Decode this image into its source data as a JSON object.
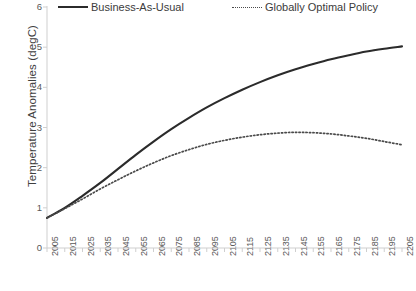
{
  "chart_data": {
    "type": "line",
    "title": "",
    "xlabel": "",
    "ylabel": "Temperature Anomalies (degC)",
    "xlim": [
      2005,
      2205
    ],
    "ylim": [
      0,
      6
    ],
    "grid": false,
    "legend_position": "top",
    "x": [
      2005,
      2015,
      2025,
      2035,
      2045,
      2055,
      2065,
      2075,
      2085,
      2095,
      2105,
      2115,
      2125,
      2135,
      2145,
      2155,
      2165,
      2175,
      2185,
      2195,
      2205
    ],
    "xticklabels": [
      "2005",
      "2015",
      "2025",
      "2035",
      "2045",
      "2055",
      "2065",
      "2075",
      "2085",
      "2095",
      "2105",
      "2115",
      "2125",
      "2135",
      "2145",
      "2155",
      "2165",
      "2175",
      "2185",
      "2195",
      "2205"
    ],
    "yticklabels": [
      "0",
      "1",
      "2",
      "3",
      "4",
      "5",
      "6"
    ],
    "yticks": [
      0,
      1,
      2,
      3,
      4,
      5,
      6
    ],
    "series": [
      {
        "name": "Business-As-Usual",
        "style": "solid",
        "color": "#2b2b2b",
        "values": [
          0.75,
          1.0,
          1.3,
          1.62,
          1.97,
          2.32,
          2.65,
          2.96,
          3.24,
          3.5,
          3.73,
          3.94,
          4.13,
          4.3,
          4.45,
          4.58,
          4.7,
          4.8,
          4.89,
          4.96,
          5.02
        ]
      },
      {
        "name": "Globally Optimal Policy",
        "style": "dotted",
        "color": "#4a4a4a",
        "values": [
          0.75,
          0.98,
          1.22,
          1.47,
          1.7,
          1.92,
          2.12,
          2.3,
          2.45,
          2.58,
          2.68,
          2.76,
          2.82,
          2.86,
          2.88,
          2.87,
          2.84,
          2.79,
          2.73,
          2.65,
          2.57
        ]
      }
    ]
  },
  "legend": {
    "entries": [
      {
        "label": "Business-As-Usual"
      },
      {
        "label": "Globally Optimal Policy"
      }
    ]
  },
  "axes": {
    "y_title": "Temperature Anomalies (degC)"
  },
  "colors": {
    "bau_line": "#2b2b2b",
    "policy_line": "#4a4a4a",
    "axis": "#c9c9c9",
    "text": "#585858"
  }
}
